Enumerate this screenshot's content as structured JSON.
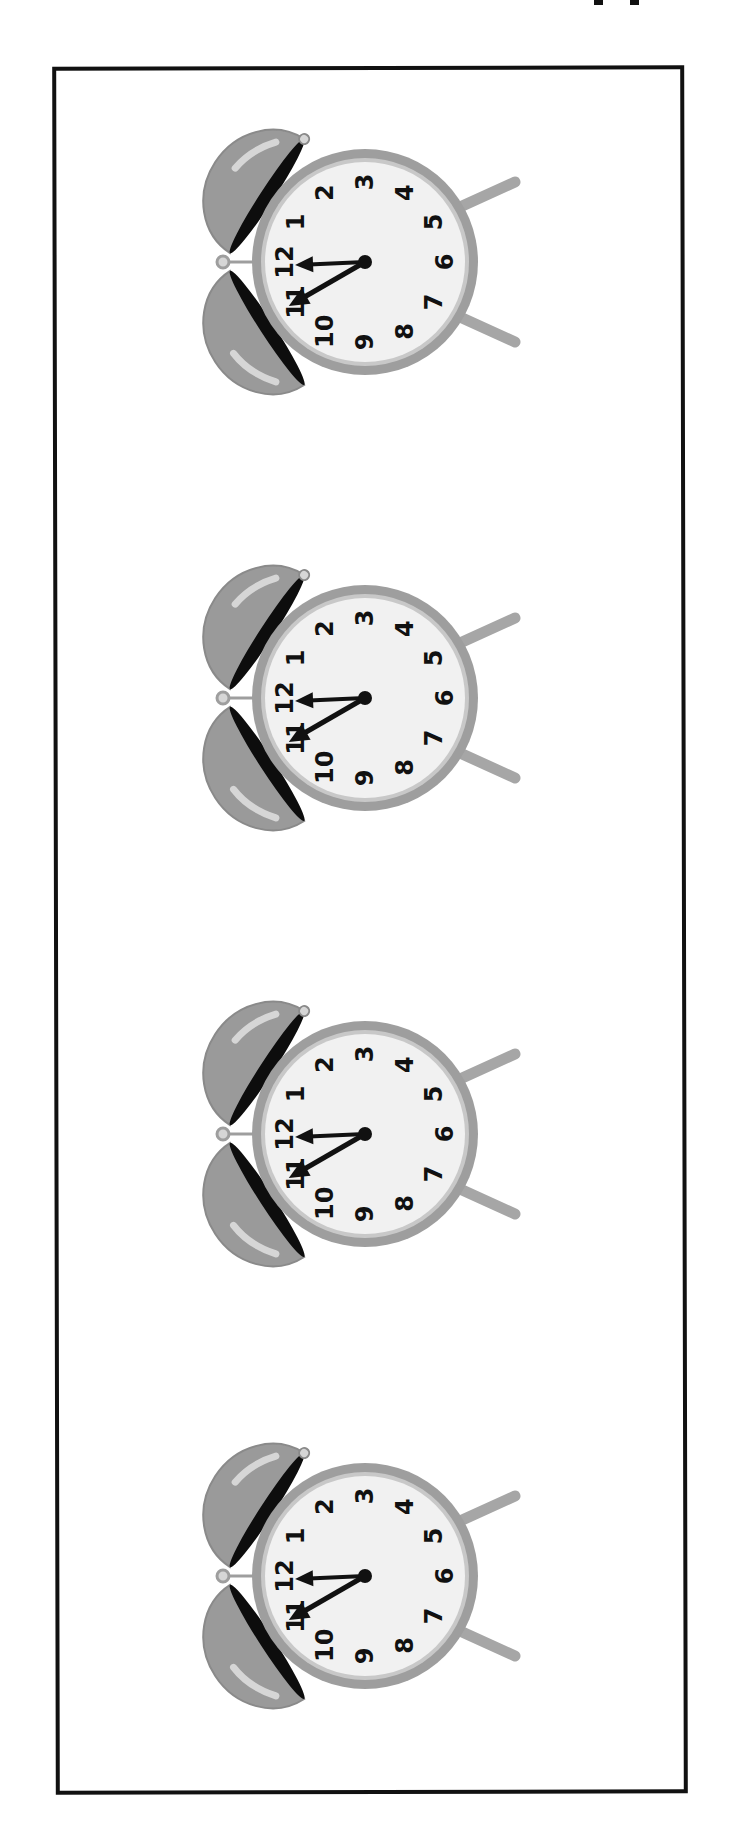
{
  "page": {
    "background": "#ffffff",
    "frame_color": "#111111"
  },
  "colors": {
    "bell": "#9a9a9a",
    "bell_highlight": "#d6d6d6",
    "bell_inner": "#0d0d0d",
    "rim": "#9e9e9e",
    "face": "#f1f1f1",
    "hands": "#111111",
    "legs": "#a6a6a6"
  },
  "clock_numerals": [
    "12",
    "1",
    "2",
    "3",
    "4",
    "5",
    "6",
    "7",
    "8",
    "9",
    "10",
    "11"
  ],
  "clocks": [
    {
      "label": "Clock 1",
      "time": "11:55",
      "hour_angle_deg": -2.5,
      "minute_angle_deg": -30,
      "top_px": 97
    },
    {
      "label": "Clock 2",
      "time": "11:55",
      "hour_angle_deg": -2.5,
      "minute_angle_deg": -30,
      "top_px": 533
    },
    {
      "label": "Clock 3",
      "time": "11:55",
      "hour_angle_deg": -2.5,
      "minute_angle_deg": -30,
      "top_px": 969
    },
    {
      "label": "Clock 4",
      "time": "11:55",
      "hour_angle_deg": -2.5,
      "minute_angle_deg": -30,
      "top_px": 1411
    }
  ]
}
